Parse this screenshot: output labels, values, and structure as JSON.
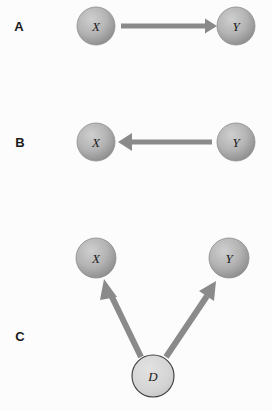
{
  "figure": {
    "background_color": "#fcfcfc",
    "node_fill_light": "#c9c9c9",
    "node_fill_dark": "#8f8f8f",
    "node_open_fill": "#d8d8d8",
    "edge_color": "#8a8a8a",
    "label_color": "#1a1a1a"
  },
  "panels": [
    {
      "id": "A",
      "label": "A",
      "label_x": 19,
      "label_y": 28,
      "caption": "X causes Y",
      "nodes": [
        {
          "id": "A-X",
          "label": "X",
          "x": 96,
          "y": 26,
          "r": 19,
          "style": "shaded"
        },
        {
          "id": "A-Y",
          "label": "Y",
          "x": 236,
          "y": 26,
          "r": 19,
          "style": "shaded"
        }
      ],
      "edges": [
        {
          "id": "A-X-to-Y",
          "from": "X",
          "to": "Y",
          "x1": 121,
          "y1": 26,
          "x2": 212,
          "y2": 26,
          "width": 5
        }
      ]
    },
    {
      "id": "B",
      "label": "B",
      "label_x": 20,
      "label_y": 144,
      "caption": "Y causes X",
      "nodes": [
        {
          "id": "B-X",
          "label": "X",
          "x": 96,
          "y": 142,
          "r": 19,
          "style": "shaded"
        },
        {
          "id": "B-Y",
          "label": "Y",
          "x": 236,
          "y": 142,
          "r": 19,
          "style": "shaded"
        }
      ],
      "edges": [
        {
          "id": "B-Y-to-X",
          "from": "Y",
          "to": "X",
          "x1": 212,
          "y1": 142,
          "x2": 121,
          "y2": 142,
          "width": 5
        }
      ]
    },
    {
      "id": "C",
      "label": "C",
      "label_x": 20,
      "label_y": 338,
      "caption": "D confounds X and Y",
      "nodes": [
        {
          "id": "C-X",
          "label": "X",
          "x": 96,
          "y": 258,
          "r": 20,
          "style": "shaded"
        },
        {
          "id": "C-Y",
          "label": "Y",
          "x": 229,
          "y": 258,
          "r": 20,
          "style": "shaded"
        },
        {
          "id": "C-D",
          "label": "D",
          "x": 153,
          "y": 376,
          "r": 21,
          "style": "open"
        }
      ],
      "edges": [
        {
          "id": "C-D-to-X",
          "from": "D",
          "to": "X",
          "x1": 139,
          "y1": 358,
          "x2": 105,
          "y2": 283,
          "width": 6
        },
        {
          "id": "C-D-to-Y",
          "from": "D",
          "to": "Y",
          "x1": 168,
          "y1": 358,
          "x2": 218,
          "y2": 283,
          "width": 6
        }
      ]
    }
  ]
}
